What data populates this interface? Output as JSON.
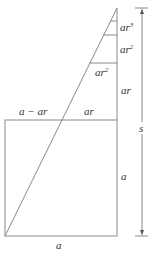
{
  "diagram": {
    "labels": {
      "seg_top": "ar",
      "seg_top_exp": "3",
      "seg_2": "ar",
      "seg_2_exp": "2",
      "inner_ar2": "ar",
      "inner_ar2_exp": "2",
      "seg_ar": "ar",
      "square_top_left": "a − ar",
      "square_top_right": "ar",
      "square_right": "a",
      "square_bottom": "a",
      "total_height": "s"
    },
    "colors": {
      "line": "#8a8a8a",
      "text": "#333333",
      "background": "#ffffff"
    }
  }
}
